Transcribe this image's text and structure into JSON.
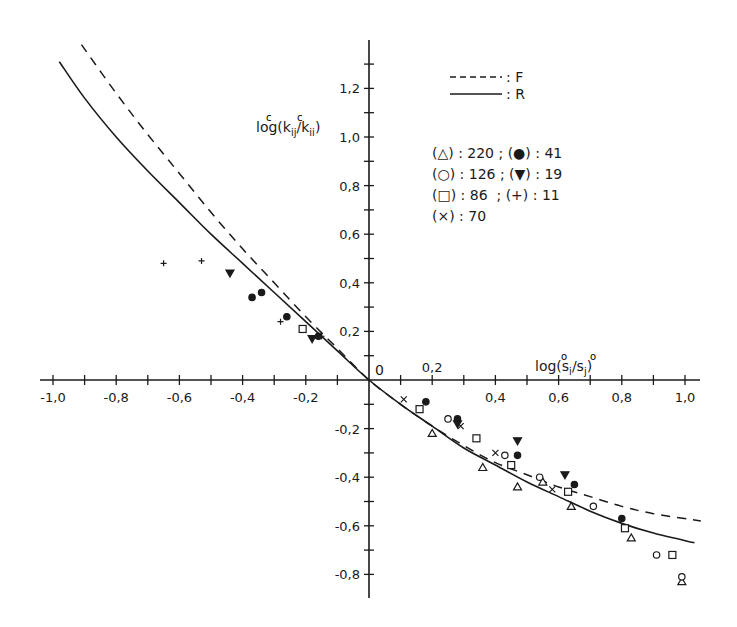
{
  "chart_data": {
    "type": "scatter",
    "title": "",
    "xlabel": "log(s_i^o / s_j^o)",
    "ylabel": "log(k_ij^c / k_ii^c)",
    "xlim": [
      -1.0,
      1.0
    ],
    "ylim": [
      -0.9,
      1.4
    ],
    "grid": false,
    "x_ticks": [
      -1.0,
      -0.8,
      -0.6,
      -0.4,
      -0.2,
      0,
      0.2,
      0.4,
      0.6,
      0.8,
      1.0
    ],
    "x_tick_labels": [
      "-1,0",
      "-0,8",
      "-0,6",
      "-0,4",
      "-0,2",
      "0",
      "0,2",
      "0,4",
      "0,6",
      "0,8",
      "1,0"
    ],
    "y_ticks": [
      -0.8,
      -0.6,
      -0.4,
      -0.2,
      0.2,
      0.4,
      0.6,
      0.8,
      1.0,
      1.2
    ],
    "y_tick_labels": [
      "-0,8",
      "-0,6",
      "-0,4",
      "-0,2",
      "0,2",
      "0,4",
      "0,6",
      "0,8",
      "1,0",
      "1,2"
    ],
    "origin_label": "0",
    "legend_lines": [
      {
        "style": "dashed",
        "label": ": F"
      },
      {
        "style": "solid",
        "label": ": R"
      }
    ],
    "legend_markers": [
      "(△) : 220 ; (●) : 41",
      "(○) : 126 ; (▼) : 19",
      "(□) : 86  ; (+) : 11",
      "(×) : 70"
    ],
    "series": [
      {
        "name": "F",
        "kind": "line",
        "style": "dashed",
        "x": [
          -0.91,
          -0.8,
          -0.7,
          -0.6,
          -0.5,
          -0.4,
          -0.3,
          -0.2,
          -0.1,
          0,
          0.1,
          0.2,
          0.3,
          0.4,
          0.5,
          0.6,
          0.7,
          0.8,
          0.9,
          1.05
        ],
        "y": [
          1.38,
          1.18,
          1.01,
          0.85,
          0.69,
          0.54,
          0.4,
          0.26,
          0.13,
          0,
          -0.1,
          -0.19,
          -0.27,
          -0.34,
          -0.39,
          -0.44,
          -0.48,
          -0.52,
          -0.55,
          -0.58
        ]
      },
      {
        "name": "R",
        "kind": "line",
        "style": "solid",
        "x": [
          -0.98,
          -0.9,
          -0.8,
          -0.7,
          -0.6,
          -0.5,
          -0.4,
          -0.3,
          -0.2,
          -0.1,
          0,
          0.1,
          0.2,
          0.3,
          0.4,
          0.5,
          0.6,
          0.7,
          0.8,
          0.9,
          1.03
        ],
        "y": [
          1.31,
          1.16,
          1.0,
          0.86,
          0.73,
          0.6,
          0.48,
          0.36,
          0.24,
          0.12,
          0,
          -0.1,
          -0.19,
          -0.28,
          -0.35,
          -0.42,
          -0.48,
          -0.54,
          -0.59,
          -0.63,
          -0.67
        ]
      },
      {
        "name": "220",
        "marker": "triangle",
        "x": [
          0.2,
          0.36,
          0.47,
          0.55,
          0.64,
          0.83,
          0.99
        ],
        "y": [
          -0.22,
          -0.36,
          -0.44,
          -0.42,
          -0.52,
          -0.65,
          -0.83
        ]
      },
      {
        "name": "126",
        "marker": "circle",
        "x": [
          0.25,
          0.43,
          0.54,
          0.71,
          0.91,
          0.99
        ],
        "y": [
          -0.16,
          -0.31,
          -0.4,
          -0.52,
          -0.72,
          -0.81
        ]
      },
      {
        "name": "86",
        "marker": "square",
        "x": [
          -0.21,
          0.16,
          0.34,
          0.45,
          0.63,
          0.81,
          0.96
        ],
        "y": [
          0.21,
          -0.12,
          -0.24,
          -0.35,
          -0.46,
          -0.61,
          -0.72
        ]
      },
      {
        "name": "70",
        "marker": "cross",
        "x": [
          0.11,
          0.29,
          0.4,
          0.58
        ],
        "y": [
          -0.08,
          -0.19,
          -0.3,
          -0.45
        ]
      },
      {
        "name": "41",
        "marker": "dot",
        "x": [
          -0.37,
          -0.34,
          -0.26,
          -0.16,
          0.18,
          0.28,
          0.47,
          0.65,
          0.8
        ],
        "y": [
          0.34,
          0.36,
          0.26,
          0.18,
          -0.09,
          -0.16,
          -0.31,
          -0.43,
          -0.57
        ]
      },
      {
        "name": "19",
        "marker": "triangle-down",
        "x": [
          -0.44,
          -0.18,
          0.28,
          0.47,
          0.62
        ],
        "y": [
          0.44,
          0.17,
          -0.18,
          -0.25,
          -0.39
        ]
      },
      {
        "name": "11",
        "marker": "plus",
        "x": [
          -0.65,
          -0.53,
          -0.28,
          -0.15
        ],
        "y": [
          0.48,
          0.49,
          0.24,
          0.18
        ]
      }
    ]
  }
}
